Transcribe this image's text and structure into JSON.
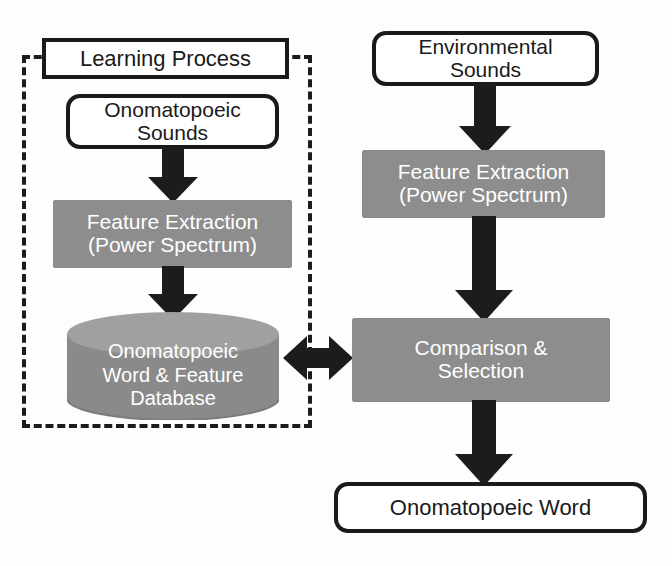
{
  "diagram": {
    "type": "flowchart",
    "colors": {
      "stroke": "#1a1a1a",
      "fill_process": "#8d8d8d",
      "fill_cylinder_body": "#8a8a8a",
      "fill_cylinder_top": "#9d9d9d",
      "arrow": "#1c1c1c",
      "background": "#fdfdfd",
      "node_text_light": "#ffffff",
      "node_text_dark": "#1a1a1a"
    },
    "groups": [
      {
        "id": "learning-process-group",
        "label": "Learning Process",
        "border_style": "dashed"
      }
    ],
    "nodes": {
      "learning_process": {
        "label": "Learning Process",
        "shape": "rectangle",
        "style": "outline"
      },
      "onomatopoeic_sounds": {
        "label": "Onomatopoeic\nSounds",
        "shape": "rounded-rectangle",
        "style": "outline"
      },
      "feature_extraction_left": {
        "label": "Feature Extraction\n(Power Spectrum)",
        "shape": "rectangle",
        "style": "filled"
      },
      "database": {
        "label": "Onomatopoeic\nWord & Feature\nDatabase",
        "shape": "cylinder",
        "style": "filled"
      },
      "environmental_sounds": {
        "label": "Environmental\nSounds",
        "shape": "rounded-rectangle",
        "style": "outline"
      },
      "feature_extraction_right": {
        "label": "Feature Extraction\n(Power Spectrum)",
        "shape": "rectangle",
        "style": "filled"
      },
      "comparison_selection": {
        "label": "Comparison &\nSelection",
        "shape": "rectangle",
        "style": "filled"
      },
      "onomatopoeic_word": {
        "label": "Onomatopoeic Word",
        "shape": "rounded-rectangle",
        "style": "outline"
      }
    },
    "edges": [
      {
        "id": "edge-sounds-to-feature-left",
        "from": "onomatopoeic_sounds",
        "to": "feature_extraction_left",
        "direction": "down"
      },
      {
        "id": "edge-feature-left-to-database",
        "from": "feature_extraction_left",
        "to": "database",
        "direction": "down"
      },
      {
        "id": "edge-database-comparison",
        "from": "database",
        "to": "comparison_selection",
        "direction": "bidirectional"
      },
      {
        "id": "edge-env-to-feature-right",
        "from": "environmental_sounds",
        "to": "feature_extraction_right",
        "direction": "down"
      },
      {
        "id": "edge-feature-right-to-comparison",
        "from": "feature_extraction_right",
        "to": "comparison_selection",
        "direction": "down"
      },
      {
        "id": "edge-comparison-to-word",
        "from": "comparison_selection",
        "to": "onomatopoeic_word",
        "direction": "down"
      }
    ]
  }
}
